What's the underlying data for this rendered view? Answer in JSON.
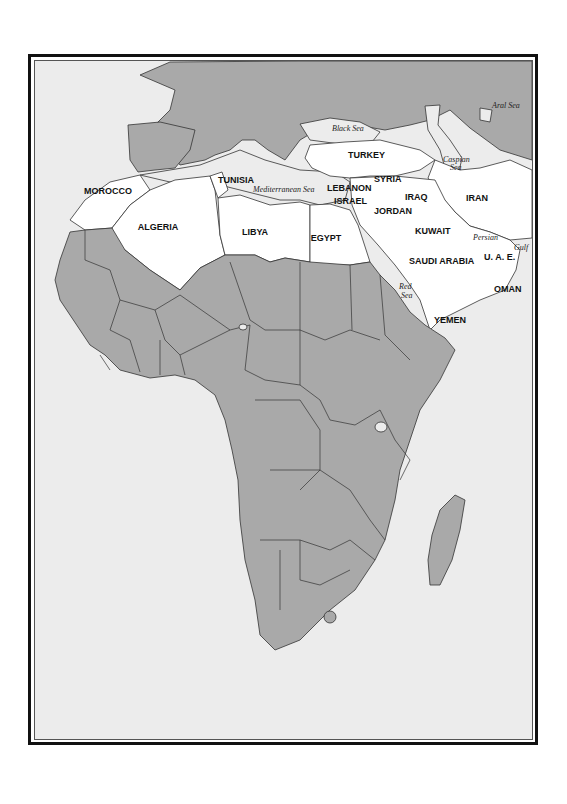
{
  "map": {
    "colors": {
      "land": "#a9a9a9",
      "highlight": "#ffffff",
      "sea": "#ececec",
      "border": "#333333",
      "frame": "#111111"
    },
    "countries": [
      {
        "name": "MOROCCO",
        "x": 108,
        "y": 194
      },
      {
        "name": "TUNISIA",
        "x": 218,
        "y": 183
      },
      {
        "name": "ALGERIA",
        "x": 158,
        "y": 230
      },
      {
        "name": "LIBYA",
        "x": 255,
        "y": 235
      },
      {
        "name": "EGYPT",
        "x": 326,
        "y": 241
      },
      {
        "name": "TURKEY",
        "x": 348,
        "y": 158
      },
      {
        "name": "LEBANON",
        "x": 327,
        "y": 191
      },
      {
        "name": "ISRAEL",
        "x": 334,
        "y": 204
      },
      {
        "name": "SYRIA",
        "x": 374,
        "y": 182
      },
      {
        "name": "JORDAN",
        "x": 374,
        "y": 214
      },
      {
        "name": "IRAQ",
        "x": 405,
        "y": 200
      },
      {
        "name": "IRAN",
        "x": 466,
        "y": 201
      },
      {
        "name": "KUWAIT",
        "x": 415,
        "y": 234
      },
      {
        "name": "SAUDI ARABIA",
        "x": 409,
        "y": 264
      },
      {
        "name": "U. A. E.",
        "x": 484,
        "y": 260
      },
      {
        "name": "OMAN",
        "x": 494,
        "y": 292
      },
      {
        "name": "YEMEN",
        "x": 434,
        "y": 323
      }
    ],
    "seas": [
      {
        "name": "Aral Sea",
        "x": 492,
        "y": 108
      },
      {
        "name": "Black Sea",
        "x": 332,
        "y": 131
      },
      {
        "name": "Caspian",
        "x": 443,
        "y": 162
      },
      {
        "name": "Sea",
        "x": 450,
        "y": 170
      },
      {
        "name": "Mediterranean Sea",
        "x": 253,
        "y": 192
      },
      {
        "name": "Persian",
        "x": 473,
        "y": 240
      },
      {
        "name": "Gulf",
        "x": 514,
        "y": 250
      },
      {
        "name": "Red",
        "x": 399,
        "y": 289
      },
      {
        "name": "Sea",
        "x": 401,
        "y": 298
      }
    ]
  }
}
